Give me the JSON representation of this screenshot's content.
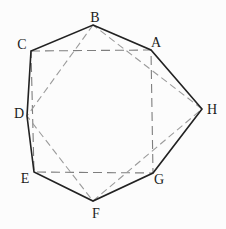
{
  "diagram": {
    "kind": "geometric-figure",
    "canvas": {
      "width": 226,
      "height": 229,
      "background": "#fcfcfc"
    },
    "colors": {
      "solid_stroke": "#222222",
      "square_dash_stroke": "#7e7e7e",
      "diamond_dash_stroke": "#9b9b9b",
      "label_color": "#1b1b1b"
    },
    "vertices": {
      "A": {
        "x": 151,
        "y": 50
      },
      "B": {
        "x": 93,
        "y": 25
      },
      "C": {
        "x": 31,
        "y": 51
      },
      "D": {
        "x": 27,
        "y": 116
      },
      "E": {
        "x": 34,
        "y": 172
      },
      "F": {
        "x": 93,
        "y": 201
      },
      "G": {
        "x": 153,
        "y": 173
      },
      "H": {
        "x": 202,
        "y": 109
      }
    },
    "solid_polygon": {
      "name": "octagon-outline",
      "points": [
        "B",
        "A",
        "H",
        "G",
        "F",
        "E",
        "D",
        "C"
      ],
      "stroke_width": 1.6
    },
    "dashed_quads": [
      {
        "name": "dashed-square-CAGE",
        "points": [
          "C",
          "A",
          "G",
          "E"
        ],
        "dash": "9,5",
        "color_key": "square_dash_stroke",
        "stroke_width": 1.1
      },
      {
        "name": "dashed-diamond-BDFH",
        "points": [
          "B",
          "D",
          "F",
          "H"
        ],
        "dash": "7,4",
        "color_key": "diamond_dash_stroke",
        "stroke_width": 1.1
      }
    ],
    "labels": [
      {
        "text": "A",
        "x": 156,
        "y": 47
      },
      {
        "text": "B",
        "x": 95,
        "y": 22
      },
      {
        "text": "C",
        "x": 22,
        "y": 49
      },
      {
        "text": "D",
        "x": 19,
        "y": 118
      },
      {
        "text": "E",
        "x": 25,
        "y": 183
      },
      {
        "text": "F",
        "x": 96,
        "y": 218
      },
      {
        "text": "G",
        "x": 159,
        "y": 184
      },
      {
        "text": "H",
        "x": 212,
        "y": 114
      }
    ]
  }
}
